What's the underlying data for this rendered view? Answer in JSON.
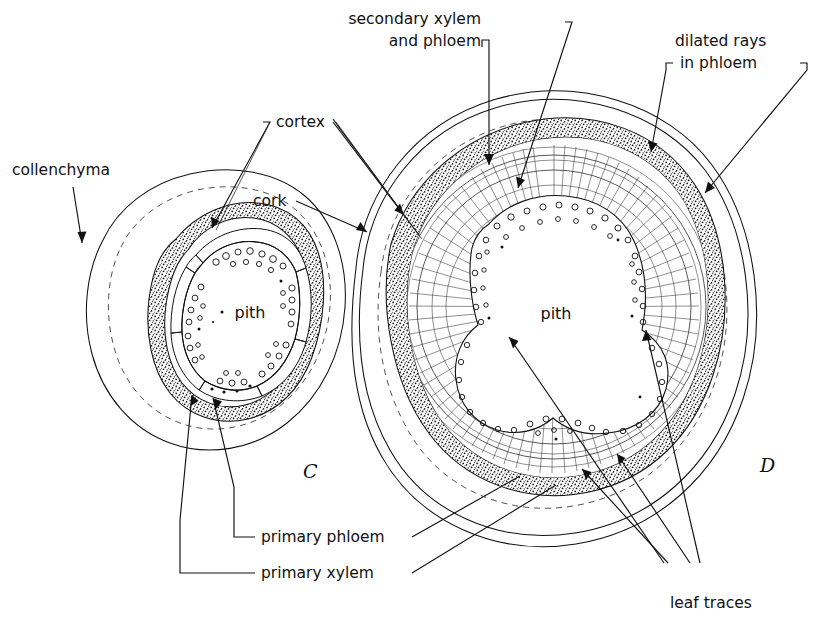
{
  "figure": {
    "kind": "botanical-cross-section-diagram",
    "background_color": "#ffffff",
    "ink_color": "#111111"
  },
  "panels": [
    {
      "id": "C",
      "letter": "C",
      "center_label": "pith"
    },
    {
      "id": "D",
      "letter": "D",
      "center_label": "pith"
    }
  ],
  "labels": {
    "collenchyma": "collenchyma",
    "cortex": "cortex",
    "cork": "cork",
    "secondary_xylem_and_phloem_line1": "secondary xylem",
    "secondary_xylem_and_phloem_line2": "and phloem",
    "dilated_rays_line1": "dilated rays",
    "dilated_rays_line2": "in phloem",
    "primary_phloem": "primary phloem",
    "primary_xylem": "primary xylem",
    "leaf_traces": "leaf traces",
    "pith": "pith"
  },
  "panel_letters": {
    "c": "C",
    "d": "D"
  },
  "colors": {
    "ink": "#111111",
    "hairline": "#333333",
    "paper": "#ffffff"
  }
}
